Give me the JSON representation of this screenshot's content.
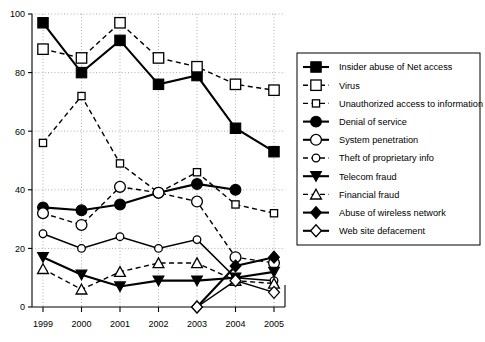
{
  "chart_data": {
    "type": "line",
    "title": "",
    "xlabel": "",
    "ylabel": "",
    "categories": [
      "1999",
      "2000",
      "2001",
      "2002",
      "2003",
      "2004",
      "2005"
    ],
    "x": [
      1999,
      2000,
      2001,
      2002,
      2003,
      2004,
      2005
    ],
    "ylim": [
      0,
      100
    ],
    "xlim": [
      1999,
      2005
    ],
    "yticks": [
      0,
      20,
      40,
      60,
      80,
      100
    ],
    "ytick_labels": [
      "0",
      "20",
      "40",
      "60",
      "80",
      "100"
    ],
    "xtick_labels": [
      "1999",
      "2000",
      "2001",
      "2002",
      "2003",
      "2004",
      "2005"
    ],
    "grid": true,
    "legend_position": "right",
    "series": [
      {
        "name": "Insider abuse of Net access",
        "marker": "filled-square",
        "line": "solid",
        "values": [
          97,
          80,
          91,
          76,
          79,
          61,
          53
        ]
      },
      {
        "name": "Virus",
        "marker": "open-square",
        "line": "dashed",
        "values": [
          88,
          85,
          97,
          85,
          82,
          76,
          74
        ]
      },
      {
        "name": "Unauthorized access to information",
        "marker": "open-square-small",
        "line": "dashed",
        "values": [
          56,
          72,
          49,
          39,
          46,
          35,
          32
        ]
      },
      {
        "name": "Denial of service",
        "marker": "filled-circle",
        "line": "solid",
        "values": [
          34,
          33,
          35,
          39,
          42,
          40,
          null
        ]
      },
      {
        "name": "System penetration",
        "marker": "open-circle",
        "line": "dashed",
        "values": [
          32,
          28,
          41,
          39,
          36,
          17,
          15
        ]
      },
      {
        "name": "Theft of proprietary info",
        "marker": "open-circle-small",
        "line": "solid",
        "values": [
          25,
          20,
          24,
          20,
          23,
          10,
          9
        ]
      },
      {
        "name": "Telecom fraud",
        "marker": "filled-triangle",
        "line": "solid",
        "values": [
          17,
          11,
          7,
          9,
          9,
          10,
          12
        ]
      },
      {
        "name": "Financial fraud",
        "marker": "open-triangle",
        "line": "dashed",
        "values": [
          13,
          6,
          12,
          15,
          15,
          9,
          8
        ]
      },
      {
        "name": "Abuse of wireless network",
        "marker": "filled-diamond",
        "line": "solid",
        "values": [
          null,
          null,
          null,
          null,
          0,
          14,
          17
        ]
      },
      {
        "name": "Web site defacement",
        "marker": "open-diamond",
        "line": "solid",
        "values": [
          null,
          null,
          null,
          null,
          0,
          9,
          5
        ]
      }
    ]
  },
  "legend": {
    "items": [
      {
        "label": "Insider abuse of Net access",
        "marker": "filled-square-icon"
      },
      {
        "label": "Virus",
        "marker": "open-square-icon"
      },
      {
        "label": "Unauthorized access to information",
        "marker": "open-square-small-icon"
      },
      {
        "label": "Denial of service",
        "marker": "filled-circle-icon"
      },
      {
        "label": "System penetration",
        "marker": "open-circle-icon"
      },
      {
        "label": "Theft of proprietary info",
        "marker": "open-circle-small-icon"
      },
      {
        "label": "Telecom fraud",
        "marker": "filled-triangle-icon"
      },
      {
        "label": "Financial fraud",
        "marker": "open-triangle-icon"
      },
      {
        "label": "Abuse of wireless network",
        "marker": "filled-diamond-icon"
      },
      {
        "label": "Web site defacement",
        "marker": "open-diamond-icon"
      }
    ]
  },
  "axes": {
    "y_labels": [
      "100",
      "80",
      "60",
      "40",
      "20",
      "0"
    ],
    "x_labels": [
      "1999",
      "2000",
      "2001",
      "2002",
      "2003",
      "2004",
      "2005"
    ]
  },
  "colors": {
    "ink": "#000000",
    "grid": "#9a9a9a",
    "background": "#ffffff"
  }
}
